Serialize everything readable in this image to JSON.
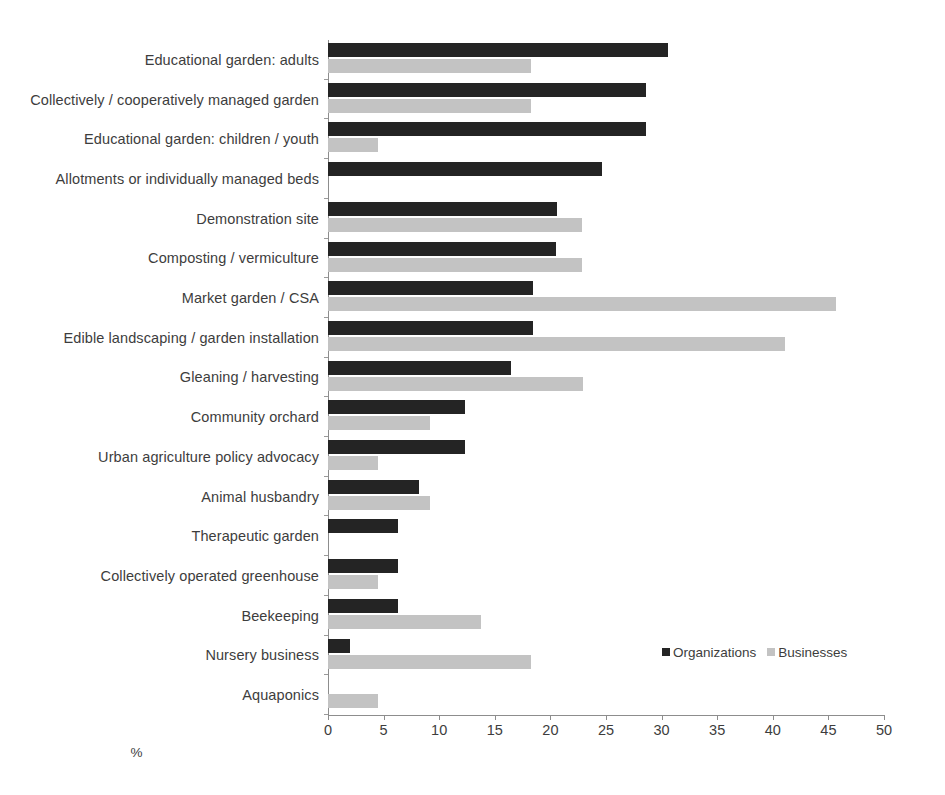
{
  "chart_data": {
    "type": "bar",
    "orientation": "horizontal",
    "title": "",
    "xlabel": "%",
    "ylabel": "",
    "xlim": [
      0,
      50
    ],
    "xticks": [
      0,
      5,
      10,
      15,
      20,
      25,
      30,
      35,
      40,
      45,
      50
    ],
    "grid": false,
    "legend_position": "bottom-right",
    "categories": [
      "Educational garden: adults",
      "Collectively / cooperatively managed garden",
      "Educational garden: children / youth",
      "Allotments or individually managed beds",
      "Demonstration site",
      "Composting / vermiculture",
      "Market garden / CSA",
      "Edible landscaping / garden installation",
      "Gleaning / harvesting",
      "Community orchard",
      "Urban agriculture policy advocacy",
      "Animal husbandry",
      "Therapeutic garden",
      "Collectively operated greenhouse",
      "Beekeeping",
      "Nursery business",
      "Aquaponics"
    ],
    "series": [
      {
        "name": "Organizations",
        "color": "#242424",
        "values": [
          30.6,
          28.6,
          28.6,
          24.6,
          20.6,
          20.5,
          18.4,
          18.4,
          16.5,
          12.3,
          12.3,
          8.2,
          6.3,
          6.3,
          6.3,
          2.0,
          0
        ]
      },
      {
        "name": "Businesses",
        "color": "#c3c3c3",
        "values": [
          18.3,
          18.3,
          4.5,
          0,
          22.8,
          22.8,
          45.7,
          41.1,
          22.9,
          9.2,
          4.5,
          9.2,
          0,
          4.5,
          13.8,
          18.3,
          4.5
        ]
      }
    ]
  }
}
